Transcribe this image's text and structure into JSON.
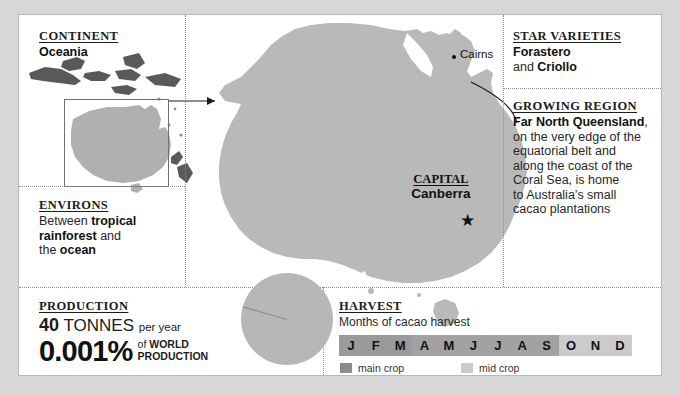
{
  "panels": {
    "continent": {
      "header": "CONTINENT",
      "value": "Oceania"
    },
    "environs": {
      "header": "ENVIRONS",
      "line1_a": "Between ",
      "line1_b": "tropical",
      "line2_a": "rainforest",
      "line2_b": " and",
      "line3_a": "the ",
      "line3_b": "ocean"
    },
    "production": {
      "header": "PRODUCTION",
      "amount": "40",
      "unit": "TONNES",
      "per": "per year",
      "percent": "0.001%",
      "of_word": "of",
      "of_what_1": "WORLD",
      "of_what_2": "PRODUCTION"
    },
    "star_varieties": {
      "header": "STAR VARIETIES",
      "line1": "Forastero",
      "line2_a": "and ",
      "line2_b": "Criollo"
    },
    "growing_region": {
      "header": "GROWING REGION",
      "bold_place": "Far North Queensland",
      "comma": ",",
      "line2": "on the very edge of the",
      "line3": "equatorial belt and",
      "line4": "along the coast of the",
      "line5": "Coral Sea, is home",
      "line6": "to Australia’s small",
      "line7": "cacao plantations"
    },
    "harvest": {
      "header": "HARVEST",
      "subtitle": "Months of cacao harvest"
    }
  },
  "map": {
    "capital_header": "CAPITAL",
    "capital_name": "Canberra",
    "capital_marker": "star-marker",
    "city_label": "Cairns",
    "city_marker": "dot-marker"
  },
  "chart_data": [
    {
      "type": "table",
      "title": "Months of cacao harvest",
      "categories": [
        "J",
        "F",
        "M",
        "A",
        "M",
        "J",
        "J",
        "A",
        "S",
        "O",
        "N",
        "D"
      ],
      "series": [
        {
          "name": "main crop",
          "color": "#9a9a9a",
          "values": [
            "main",
            "main",
            "main",
            "main",
            "main",
            "main",
            "main",
            "main",
            "main",
            "mid",
            "mid",
            "mid"
          ]
        }
      ],
      "legend": [
        {
          "label": "main crop",
          "color": "#8c8c8c"
        },
        {
          "label": "mid crop",
          "color": "#cbcbcb"
        }
      ],
      "legend_position": "bottom-left"
    },
    {
      "type": "pie",
      "title": "Share of world cacao production",
      "labels": [
        "Rest of world",
        "Australia"
      ],
      "values": [
        99.999,
        0.001
      ],
      "colors": [
        "#b7b7b7",
        "#8a8a8a"
      ]
    }
  ]
}
